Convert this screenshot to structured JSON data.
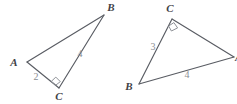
{
  "figure": {
    "type": "geometry-diagram",
    "background_color": "#ffffff",
    "stroke_color": "#595c63",
    "label_color": "#3f4247",
    "measure_color": "#8b8e94",
    "right_angle_color": "#8d9096",
    "triangles": [
      {
        "name": "left-triangle",
        "vertices": [
          {
            "name": "A",
            "label": "A",
            "x": 27,
            "y": 62,
            "label_x": 14,
            "label_y": 66
          },
          {
            "name": "B",
            "label": "B",
            "x": 104,
            "y": 15,
            "label_x": 111,
            "label_y": 11
          },
          {
            "name": "C",
            "label": "C",
            "x": 59,
            "y": 88,
            "label_x": 59,
            "label_y": 100
          }
        ],
        "edges": [
          {
            "name": "edge-AB",
            "from": "A",
            "to": "B"
          },
          {
            "name": "edge-BC",
            "from": "B",
            "to": "C"
          },
          {
            "name": "edge-CA",
            "from": "C",
            "to": "A"
          }
        ],
        "side_labels": [
          {
            "name": "side-label-ac",
            "value": "2",
            "x": 36,
            "y": 80
          },
          {
            "name": "side-label-bc",
            "value": "4",
            "x": 80,
            "y": 57
          }
        ],
        "right_angle_at": "C"
      },
      {
        "name": "right-triangle",
        "vertices": [
          {
            "name": "C",
            "label": "C",
            "x": 172,
            "y": 19,
            "label_x": 170,
            "label_y": 12
          },
          {
            "name": "B",
            "label": "B",
            "x": 139,
            "y": 84,
            "label_x": 129,
            "label_y": 90
          },
          {
            "name": "A",
            "label": "A",
            "x": 234,
            "y": 57,
            "label_x": 235,
            "label_y": 61
          }
        ],
        "edges": [
          {
            "name": "edge-CB",
            "from": "C",
            "to": "B"
          },
          {
            "name": "edge-BA",
            "from": "B",
            "to": "A"
          },
          {
            "name": "edge-AC",
            "from": "A",
            "to": "C"
          }
        ],
        "side_labels": [
          {
            "name": "side-label-cb",
            "value": "3",
            "x": 153,
            "y": 50
          },
          {
            "name": "side-label-ba",
            "value": "4",
            "x": 187,
            "y": 78
          }
        ],
        "right_angle_at": "C"
      }
    ]
  }
}
